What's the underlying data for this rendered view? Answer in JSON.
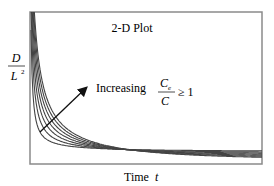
{
  "chart_data": {
    "type": "line",
    "title": "2-D Plot",
    "xlabel": "Time t",
    "xlabel_parts": {
      "text": "Time",
      "var": "t"
    },
    "ylabel": "D / L^2",
    "ylabel_parts": {
      "numerator": "D",
      "denominator": "L",
      "exponent": "2"
    },
    "annotation": {
      "text": "Increasing",
      "fraction_numerator": "C",
      "fraction_numerator_sub": "e",
      "fraction_denominator": "C",
      "relation": "≥ 1",
      "arrow": {
        "from": [
          40,
          132
        ],
        "to": [
          86,
          88
        ]
      }
    },
    "grid": false,
    "legend": null,
    "axis_ticks": "none",
    "series_count": 7,
    "series_description": "Family of decaying hyperbolic-like curves; each curve starts at the top near the y-axis and decays toward the x-axis. Curves shift up/right with increasing Ce/C.",
    "series": [
      {
        "name": "curve 1",
        "k": 3
      },
      {
        "name": "curve 2",
        "k": 5
      },
      {
        "name": "curve 3",
        "k": 7
      },
      {
        "name": "curve 4",
        "k": 9
      },
      {
        "name": "curve 5",
        "k": 11
      },
      {
        "name": "curve 6",
        "k": 13
      },
      {
        "name": "curve 7",
        "k": 15
      }
    ],
    "frame": {
      "left": 30,
      "top": 12,
      "right": 262,
      "bottom": 164
    },
    "colors": {
      "curve": "#444444",
      "frame": "#8a8a8a",
      "text": "#222222",
      "arrow": "#111111"
    }
  }
}
